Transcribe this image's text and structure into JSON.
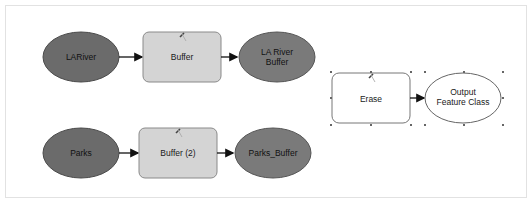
{
  "canvas": {
    "background": "#ffffff",
    "frame_border": "#e2e2e2"
  },
  "colors": {
    "input_data": "#6b6b6b",
    "derived_data": "#7a7a7a",
    "tool_fill": "#d4d4d4",
    "tool_stroke": "#8a8a8a",
    "empty_tool_fill": "#ffffff",
    "empty_output_fill": "#ffffff",
    "connector": "#111111"
  },
  "model": {
    "row1": {
      "input": {
        "label": "LARiver",
        "type": "input-data",
        "icon": "ellipse"
      },
      "tool": {
        "label": "Buffer",
        "type": "tool",
        "icon": "hammer-icon"
      },
      "output": {
        "label_line1": "LA River",
        "label_line2": "Buffer",
        "type": "derived-data",
        "icon": "ellipse"
      }
    },
    "row2": {
      "input": {
        "label": "Parks",
        "type": "input-data",
        "icon": "ellipse"
      },
      "tool": {
        "label": "Buffer (2)",
        "type": "tool",
        "icon": "hammer-icon"
      },
      "output": {
        "label": "Parks_Buffer",
        "type": "derived-data",
        "icon": "ellipse"
      }
    },
    "row3": {
      "tool": {
        "label": "Erase",
        "type": "tool-not-ready",
        "icon": "hammer-icon",
        "selected": true
      },
      "output": {
        "label_line1": "Output",
        "label_line2": "Feature Class",
        "type": "derived-data-empty",
        "icon": "ellipse",
        "selected": true
      }
    }
  }
}
